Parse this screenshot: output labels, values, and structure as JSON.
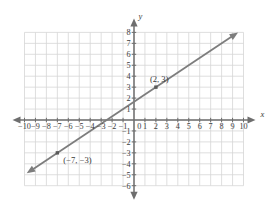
{
  "chart_data": {
    "type": "line",
    "title": "",
    "xlabel": "x",
    "ylabel": "y",
    "grid": true,
    "legend": "none",
    "xlim": [
      -10,
      10
    ],
    "ylim": [
      -6,
      8
    ],
    "x_ticks": [
      "-10",
      "-9",
      "-8",
      "-7",
      "-6",
      "-5",
      "-4",
      "-3",
      "-2",
      "-1",
      "0",
      "1",
      "2",
      "3",
      "4",
      "5",
      "6",
      "7",
      "8",
      "9",
      "10"
    ],
    "y_ticks_positive": [
      "1",
      "2",
      "3",
      "4",
      "5",
      "6",
      "7",
      "8"
    ],
    "y_ticks_negative": [
      "-1",
      "-2",
      "-3",
      "-4",
      "-5",
      "-6"
    ],
    "origin_label": "0",
    "series": [
      {
        "name": "line",
        "slope": 0.6667,
        "intercept": 1.6667,
        "x_start": -9.8,
        "y_start": -4.87,
        "x_end": 9.5,
        "y_end": 8.0,
        "arrows": "both"
      }
    ],
    "points": [
      {
        "label": "(2, 3)",
        "x": 2,
        "y": 3
      },
      {
        "label": "(−7, −3)",
        "x": -7,
        "y": -3
      }
    ],
    "colors": {
      "grid": "#d6d6d6",
      "axis": "#6e6e6e",
      "line": "#7d7d7d",
      "point": "#5a5a5a",
      "background": "#ffffff",
      "text": "#3b3b3b"
    }
  }
}
